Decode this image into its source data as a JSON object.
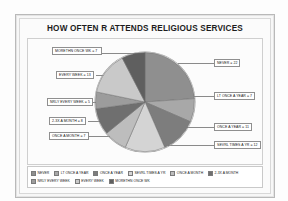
{
  "chart_data": {
    "type": "pie",
    "title": "HOW OFTEN R ATTENDS RELIGIOUS SERVICES",
    "xlabel": "",
    "ylabel": "",
    "legend_position": "bottom",
    "grid": false,
    "total": 93,
    "categories": [
      "NEVER",
      "LT ONCE A YEAR",
      "ONCE A YEAR",
      "SEVRL TIMES A YR",
      "ONCE A MONTH",
      "2-3X A MONTH",
      "NRLY EVERY WEEK",
      "EVERY WEEK",
      "MORETHN ONCE WK"
    ],
    "values": [
      22,
      7,
      11,
      12,
      7,
      8,
      5,
      13,
      7
    ],
    "colors": [
      "#8f8f8f",
      "#a8a8a8",
      "#7d7d7d",
      "#d4d4d4",
      "#bdbdbd",
      "#6f6f6f",
      "#9c9c9c",
      "#c9c9c9",
      "#5f5f5f"
    ],
    "data_labels": [
      "NEVER = 22",
      "LT ONCE A YEAR = 7",
      "ONCE A YEAR = 11",
      "SEVRL TIMES A YR = 12",
      "ONCE A MONTH = 7",
      "2-3X A MONTH = 8",
      "NRLY EVERY WEEK = 5",
      "EVERY WEEK = 13",
      "MORETHN ONCE WK = 7"
    ]
  },
  "callouts": {
    "morethn_once_wk": "MORETHN ONCE WK = 7",
    "every_week": "EVERY WEEK = 13",
    "nrly_every_week": "NRLY EVERY WEEK = 5",
    "two_three_x_month": "2-3X A MONTH = 8",
    "once_a_month": "ONCE A MONTH = 7",
    "never": "NEVER = 22",
    "lt_once_a_year": "LT ONCE A YEAR = 7",
    "once_a_year": "ONCE A YEAR = 11",
    "sevrl_times_a_yr": "SEVRL TIMES A YR = 12"
  },
  "legend": {
    "row1": [
      "NEVER",
      "LT ONCE A YEAR",
      "ONCE A YEAR",
      "SEVRL TIMES A YR",
      "ONCE A MONTH",
      "2-3X A MONTH"
    ],
    "row2": [
      "NRLY EVERY WEEK",
      "EVERY WEEK",
      "MORETHN ONCE WK"
    ]
  }
}
